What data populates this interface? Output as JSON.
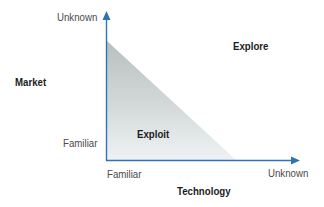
{
  "diagram": {
    "y_axis": {
      "title": "Market",
      "low_label": "Familiar",
      "high_label": "Unknown"
    },
    "x_axis": {
      "title": "Technology",
      "low_label": "Familiar",
      "high_label": "Unknown"
    },
    "regions": {
      "exploit": "Exploit",
      "explore": "Explore"
    },
    "colors": {
      "axis": "#2e74b5",
      "triangle_top": "#b9c2c0",
      "triangle_bottom": "#eef2f3",
      "label_text": "#4a4a4a",
      "bold_text": "#1c1c1c"
    }
  }
}
